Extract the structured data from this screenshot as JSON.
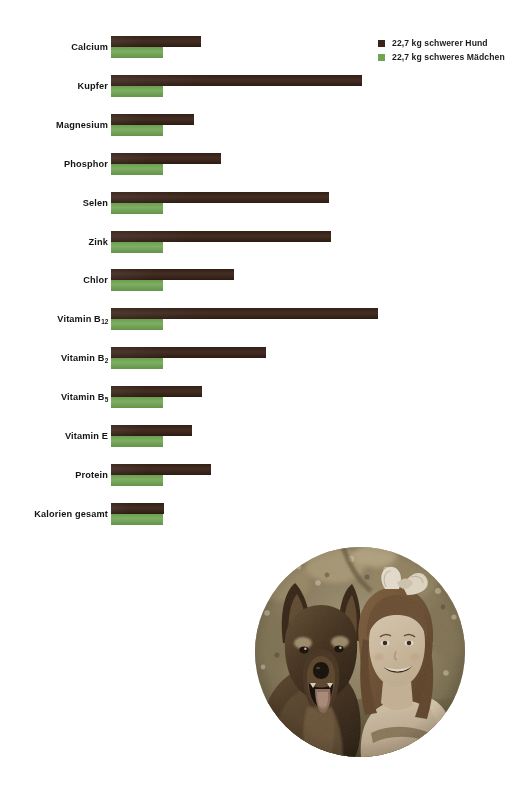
{
  "chart_data": {
    "type": "bar",
    "orientation": "horizontal",
    "title": "",
    "subtitle": "",
    "xlabel": "",
    "ylabel": "",
    "grid": false,
    "legend_position": "top-right",
    "axis_note": "Unlabeled axis; girl series is a constant 100% reference baseline, dog series shown relative to it.",
    "categories": [
      "Calcium",
      "Kupfer",
      "Magnesium",
      "Phosphor",
      "Selen",
      "Zink",
      "Chlor",
      "Vitamin B12",
      "Vitamin B2",
      "Vitamin B5",
      "Vitamin E",
      "Protein",
      "Kalorien gesamt"
    ],
    "category_labels": [
      {
        "text": "Calcium",
        "sub": ""
      },
      {
        "text": "Kupfer",
        "sub": ""
      },
      {
        "text": "Magnesium",
        "sub": ""
      },
      {
        "text": "Phosphor",
        "sub": ""
      },
      {
        "text": "Selen",
        "sub": ""
      },
      {
        "text": "Zink",
        "sub": ""
      },
      {
        "text": "Chlor",
        "sub": ""
      },
      {
        "text": "Vitamin B",
        "sub": "12"
      },
      {
        "text": "Vitamin B",
        "sub": "2"
      },
      {
        "text": "Vitamin B",
        "sub": "5"
      },
      {
        "text": "Vitamin E",
        "sub": ""
      },
      {
        "text": "Protein",
        "sub": ""
      },
      {
        "text": "Kalorien gesamt",
        "sub": ""
      }
    ],
    "series": [
      {
        "name": "22,7 kg schwerer Hund",
        "color": "#3a2318",
        "values": [
          173,
          482,
          160,
          212,
          418,
          423,
          236,
          513,
          298,
          175,
          156,
          192,
          102
        ],
        "bar_lengths_px": [
          90,
          251,
          83,
          110,
          218,
          220,
          123,
          267,
          155,
          91,
          81,
          100,
          53
        ]
      },
      {
        "name": "22,7 kg schweres Mädchen",
        "color": "#6fa551",
        "values": [
          100,
          100,
          100,
          100,
          100,
          100,
          100,
          100,
          100,
          100,
          100,
          100,
          100
        ],
        "bar_lengths_px": [
          52,
          52,
          52,
          52,
          52,
          52,
          52,
          52,
          52,
          52,
          52,
          52,
          52
        ]
      }
    ]
  },
  "legend": {
    "items": [
      {
        "label": "22,7 kg schwerer Hund",
        "color": "#3a2318"
      },
      {
        "label": "22,7 kg schweres Mädchen",
        "color": "#6fa551"
      }
    ]
  },
  "photo": {
    "caption": "Sepia-toned circular photograph of a German Shepherd dog beside a smiling girl wearing a white hair bow, lying on grass"
  }
}
